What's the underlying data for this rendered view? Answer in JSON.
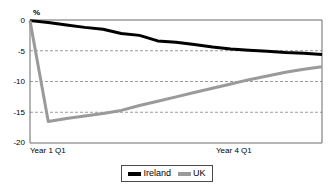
{
  "chart_data": {
    "type": "line",
    "title": "",
    "subtitle": "",
    "xlabel": "",
    "ylabel": "%",
    "ylim": [
      -20,
      0
    ],
    "yticks": [
      0,
      -5,
      -10,
      -15,
      -20
    ],
    "ytick_labels": [
      "0",
      "-5",
      "-10",
      "-15",
      "-20"
    ],
    "xlim": [
      0,
      16
    ],
    "x": [
      0,
      1,
      2,
      3,
      4,
      5,
      6,
      7,
      8,
      9,
      10,
      11,
      12,
      13,
      14,
      15,
      16
    ],
    "xtick_positions": [
      0,
      12
    ],
    "xtick_labels": [
      "Year 1 Q1",
      "Year 4 Q1"
    ],
    "grid": "horizontal-dashed",
    "gridlines": [
      -5,
      -10,
      -15
    ],
    "legend_position": "bottom-center",
    "series": [
      {
        "name": "Ireland",
        "color": "#000000",
        "values": [
          -0.1,
          -0.4,
          -0.8,
          -1.2,
          -1.5,
          -2.2,
          -2.5,
          -3.4,
          -3.6,
          -4.0,
          -4.4,
          -4.7,
          -4.9,
          -5.1,
          -5.3,
          -5.4,
          -5.6
        ]
      },
      {
        "name": "UK",
        "color": "#9a9a9a",
        "values": [
          -0.1,
          -16.5,
          -16.0,
          -15.6,
          -15.2,
          -14.7,
          -13.9,
          -13.2,
          -12.5,
          -11.8,
          -11.1,
          -10.4,
          -9.7,
          -9.1,
          -8.5,
          -8.0,
          -7.6
        ]
      }
    ]
  },
  "axis": {
    "unit_label": "%",
    "ytick_labels": [
      "0",
      "-5",
      "-10",
      "-15",
      "-20"
    ],
    "xtick_labels": [
      "Year 1 Q1",
      "Year 4 Q1"
    ]
  },
  "legend": {
    "entries": [
      {
        "label": "Ireland",
        "color": "#000000"
      },
      {
        "label": "UK",
        "color": "#9a9a9a"
      }
    ]
  }
}
